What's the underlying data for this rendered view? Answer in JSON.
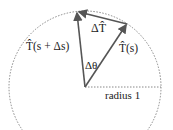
{
  "diagram": {
    "labels": {
      "delta_T": "ΔT̂",
      "T_s_plus": "T̂(s + Δs)",
      "T_s": "T̂(s)",
      "delta_theta": "Δθ",
      "radius": "radius 1"
    },
    "colors": {
      "arrow": "#555555",
      "circle": "#888888",
      "text": "#222222"
    },
    "geometry": {
      "center": [
        85,
        87
      ],
      "radius": 76
    }
  }
}
